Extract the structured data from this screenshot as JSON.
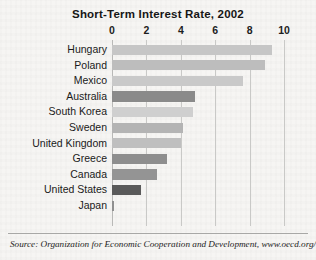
{
  "chart_data": {
    "type": "bar",
    "orientation": "horizontal",
    "title": "Short-Term Interest Rate, 2002",
    "xlabel": "",
    "ylabel": "",
    "xlim": [
      0,
      10
    ],
    "xticks": [
      0,
      2,
      4,
      6,
      8,
      10
    ],
    "xtick_labels": [
      "0",
      "2",
      "4",
      "6",
      "8",
      "10"
    ],
    "grid": true,
    "grid_axis": "x",
    "legend": false,
    "categories": [
      "Hungary",
      "Poland",
      "Mexico",
      "Australia",
      "South Korea",
      "Sweden",
      "United Kingdom",
      "Greece",
      "Canada",
      "United States",
      "Japan"
    ],
    "values": [
      9.3,
      8.9,
      7.6,
      4.8,
      4.7,
      4.1,
      4.0,
      3.2,
      2.6,
      1.7,
      0.1
    ],
    "bar_colors": [
      "#c6c6c6",
      "#bdbdbd",
      "#c9c9c9",
      "#8a8a8a",
      "#cfcfcf",
      "#b4b4b4",
      "#bfbfbf",
      "#8e8e8e",
      "#949494",
      "#5a5a5a",
      "#8f8f8f"
    ],
    "source": "Source: Organization for Economic Cooperation and Development, www.oecd.org/"
  },
  "figure": {
    "background_color": "#f6f5f3",
    "gridline_color": "#c9c9c7",
    "text_color": "#1a1a1a"
  }
}
